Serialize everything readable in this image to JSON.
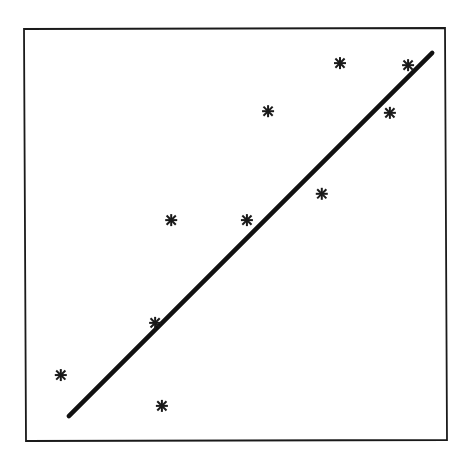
{
  "chart_data": {
    "type": "scatter",
    "title": "",
    "xlabel": "",
    "ylabel": "",
    "xlim": [
      0,
      10
    ],
    "ylim": [
      0,
      10
    ],
    "grid": false,
    "legend": null,
    "axes_ticks_visible": false,
    "marker": "asterisk",
    "series": [
      {
        "name": "observations",
        "x": [
          0.87,
          3.26,
          3.1,
          3.48,
          5.27,
          5.77,
          7.04,
          7.47,
          8.65,
          9.08
        ],
        "y": [
          1.58,
          0.83,
          2.85,
          5.35,
          5.35,
          8.0,
          5.99,
          9.17,
          7.96,
          9.12
        ]
      }
    ],
    "fit_line": {
      "name": "regression line",
      "x": [
        1.06,
        9.65
      ],
      "y": [
        0.58,
        9.42
      ]
    }
  },
  "layout": {
    "plot_area_px": {
      "left": 24,
      "top": 29,
      "right": 447,
      "bottom": 440
    },
    "colors": {
      "ink": "#111111",
      "background": "#ffffff"
    }
  }
}
